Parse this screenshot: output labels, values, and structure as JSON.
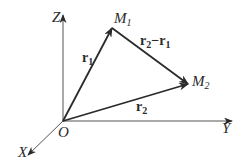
{
  "diagram": {
    "axes": {
      "z_label": "Z",
      "y_label": "Y",
      "x_label": "X",
      "origin_label": "O"
    },
    "points": {
      "m1": {
        "label": "M",
        "sub": "1"
      },
      "m2": {
        "label": "M",
        "sub": "2"
      }
    },
    "vectors": {
      "r1": {
        "label": "r",
        "sub": "1"
      },
      "r2": {
        "label": "r",
        "sub": "2"
      },
      "diff": {
        "a": "r",
        "a_sub": "2",
        "op": "−",
        "b": "r",
        "b_sub": "1"
      }
    },
    "colors": {
      "line": "#2a2a2a",
      "axis": "#555555"
    }
  }
}
